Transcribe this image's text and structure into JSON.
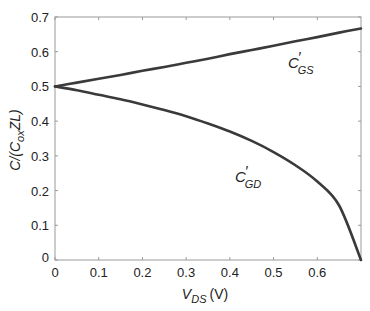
{
  "chart_data": {
    "type": "line",
    "title": "",
    "xlabel": "V_DS (V)",
    "xlabel_main": "V",
    "xlabel_sub": "DS",
    "xlabel_unit": "(V)",
    "ylabel": "C/(C_ox ZL)",
    "ylabel_parts": {
      "a": "C/(C",
      "sub": "ox",
      "b": "ZL)"
    },
    "xlim": [
      0,
      0.7
    ],
    "ylim": [
      0,
      0.7
    ],
    "xticks": [
      "0",
      "0.1",
      "0.2",
      "0.3",
      "0.4",
      "0.5",
      "0.6"
    ],
    "yticks": [
      "0",
      "0.1",
      "0.2",
      "0.3",
      "0.4",
      "0.5",
      "0.6",
      "0.7"
    ],
    "grid": false,
    "legend": "none (inline curve labels)",
    "x": [
      0,
      0.05,
      0.1,
      0.15,
      0.2,
      0.25,
      0.3,
      0.35,
      0.4,
      0.45,
      0.5,
      0.55,
      0.6,
      0.65,
      0.7
    ],
    "series": [
      {
        "name": "C'_GS",
        "label_main": "C",
        "label_prime": "′",
        "label_sub": "GS",
        "values": [
          0.5,
          0.511,
          0.522,
          0.533,
          0.545,
          0.556,
          0.568,
          0.58,
          0.593,
          0.605,
          0.617,
          0.63,
          0.642,
          0.655,
          0.667
        ]
      },
      {
        "name": "C'_GD",
        "label_main": "C",
        "label_prime": "′",
        "label_sub": "GD",
        "values": [
          0.5,
          0.489,
          0.476,
          0.463,
          0.448,
          0.432,
          0.414,
          0.393,
          0.37,
          0.343,
          0.311,
          0.273,
          0.226,
          0.157,
          0.0
        ]
      }
    ],
    "line_color": "#3a3a3a"
  }
}
